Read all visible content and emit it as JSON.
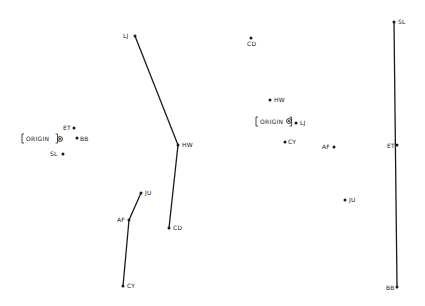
{
  "diagram": {
    "type": "multidimensional-scaling-plots",
    "panels": [
      {
        "id": "left",
        "origin": {
          "label": "ORIGIN",
          "x": 60,
          "y": 139,
          "label_x": 22,
          "label_y": 141
        },
        "points": [
          {
            "id": "ET",
            "label": "ET",
            "x": 74,
            "y": 128,
            "lx": 63,
            "ly": 130
          },
          {
            "id": "BB",
            "label": "BB",
            "x": 77,
            "y": 138,
            "lx": 80,
            "ly": 141
          },
          {
            "id": "SL",
            "label": "SL",
            "x": 63,
            "y": 154,
            "lx": 50,
            "ly": 156
          },
          {
            "id": "LJ",
            "label": "LJ",
            "x": 135,
            "y": 36,
            "lx": 123,
            "ly": 38
          },
          {
            "id": "HW",
            "label": "HW",
            "x": 178,
            "y": 145,
            "lx": 182,
            "ly": 147
          },
          {
            "id": "CD",
            "label": "CD",
            "x": 169,
            "y": 228,
            "lx": 173,
            "ly": 230
          },
          {
            "id": "JU",
            "label": "JU",
            "x": 141,
            "y": 193,
            "lx": 145,
            "ly": 195
          },
          {
            "id": "AF",
            "label": "AF",
            "x": 129,
            "y": 220,
            "lx": 117,
            "ly": 222
          },
          {
            "id": "CY",
            "label": "CY",
            "x": 123,
            "y": 286,
            "lx": 127,
            "ly": 288
          }
        ],
        "lines": [
          {
            "x1": 135,
            "y1": 36,
            "x2": 178,
            "y2": 145
          },
          {
            "x1": 178,
            "y1": 145,
            "x2": 169,
            "y2": 228
          },
          {
            "x1": 141,
            "y1": 193,
            "x2": 129,
            "y2": 220
          },
          {
            "x1": 129,
            "y1": 220,
            "x2": 123,
            "y2": 286
          }
        ]
      },
      {
        "id": "right",
        "origin": {
          "label": "ORIGIN",
          "x": 289,
          "y": 121,
          "label_x": 256,
          "label_y": 124
        },
        "points": [
          {
            "id": "CD",
            "label": "CD",
            "x": 251,
            "y": 38,
            "lx": 247,
            "ly": 46
          },
          {
            "id": "HW",
            "label": "HW",
            "x": 270,
            "y": 100,
            "lx": 274,
            "ly": 102
          },
          {
            "id": "LJ",
            "label": "LJ",
            "x": 296,
            "y": 123,
            "lx": 300,
            "ly": 125
          },
          {
            "id": "CY",
            "label": "CY",
            "x": 285,
            "y": 142,
            "lx": 288,
            "ly": 144
          },
          {
            "id": "AF",
            "label": "AF",
            "x": 334,
            "y": 147,
            "lx": 322,
            "ly": 149
          },
          {
            "id": "JU",
            "label": "JU",
            "x": 345,
            "y": 200,
            "lx": 349,
            "ly": 202
          },
          {
            "id": "SL",
            "label": "SL",
            "x": 394,
            "y": 22,
            "lx": 398,
            "ly": 24
          },
          {
            "id": "ET",
            "label": "ET",
            "x": 397,
            "y": 145,
            "lx": 387,
            "ly": 148
          },
          {
            "id": "BB",
            "label": "BB",
            "x": 397,
            "y": 287,
            "lx": 386,
            "ly": 290
          }
        ],
        "lines": [
          {
            "x1": 394,
            "y1": 22,
            "x2": 397,
            "y2": 287
          }
        ]
      }
    ],
    "colors": {
      "ink": "#1a1a1a",
      "background": "#ffffff"
    }
  }
}
